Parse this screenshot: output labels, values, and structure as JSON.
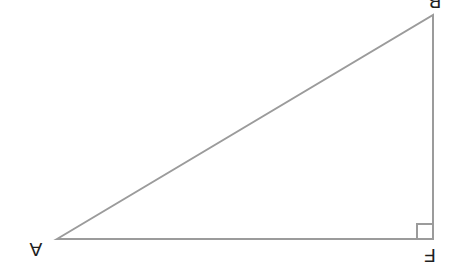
{
  "figure": {
    "type": "right-triangle",
    "background": "#ffffff",
    "stroke_color": "#9b9b9b",
    "stroke_width": "2",
    "label_color": "#1f1f1f",
    "triangle_points": "57,239 433,15 433,239",
    "right_angle_path": "M 417 239 L 417 224 L 433 224",
    "right_angle_at": "F",
    "labels_rotated_deg": 180,
    "labels": {
      "A": {
        "text": "A",
        "x": "36",
        "y": "257",
        "transform": "rotate(180 36 250)"
      },
      "B": {
        "text": "B",
        "x": "435",
        "y": "9",
        "transform": "rotate(180 435 2)"
      },
      "F": {
        "text": "F",
        "x": "430",
        "y": "263",
        "transform": "rotate(180 430 256)"
      }
    }
  }
}
